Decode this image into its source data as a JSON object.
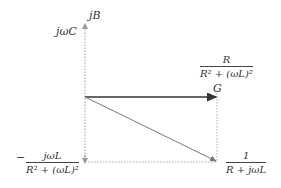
{
  "diagram": {
    "title": "",
    "axes": {
      "imag_axis_label": "jB",
      "imag_axis_value_label": "jωC"
    },
    "vectors": {
      "conductance_label": "G",
      "conductance_fraction": {
        "numerator": "R",
        "denominator": "R² + (ωL)²"
      },
      "susceptance_fraction": {
        "sign": "−",
        "numerator": "jωL",
        "denominator": "R² + (ωL)²"
      },
      "admittance_fraction": {
        "numerator": "1",
        "denominator": "R + jωL"
      }
    },
    "colors": {
      "axis": "#888888",
      "g_vector": "#333333",
      "y_vector": "#777777",
      "guide": "#aaaaaa"
    }
  }
}
